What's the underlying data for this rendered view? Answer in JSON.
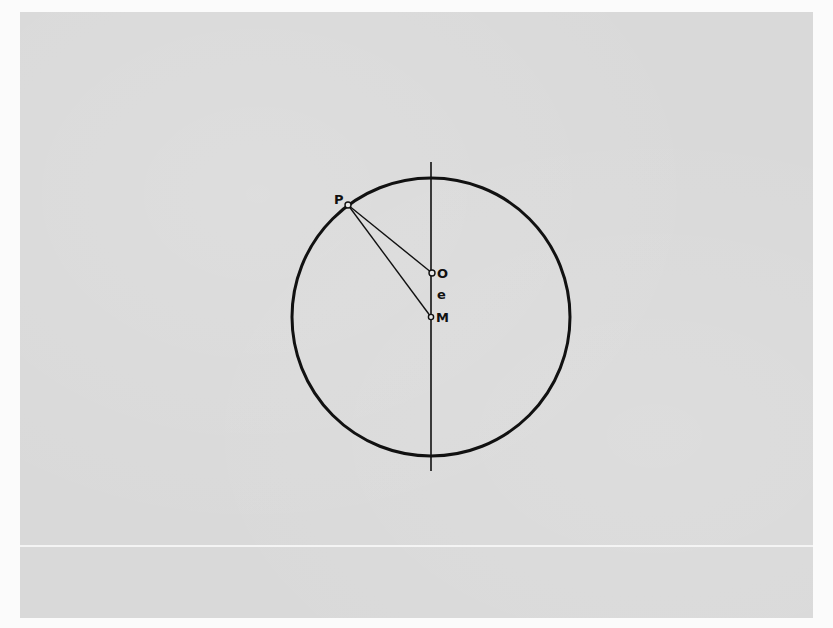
{
  "diagram": {
    "title": "",
    "colors": {
      "background": "#d9d9d9",
      "ink": "#111111",
      "margin": "#fbfbfb"
    },
    "circle": {
      "cx": 431,
      "cy": 317,
      "r": 139,
      "stroke_width": 3
    },
    "axis": {
      "x": 431,
      "y_top": 162,
      "y_bottom": 471
    },
    "points": [
      {
        "id": "P",
        "label": "P",
        "x": 348,
        "y": 205,
        "label_x": 334,
        "label_y": 204
      },
      {
        "id": "O",
        "label": "O",
        "x": 432,
        "y": 273,
        "label_x": 437,
        "label_y": 278
      },
      {
        "id": "M",
        "label": "M",
        "x": 431,
        "y": 317,
        "label_x": 436,
        "label_y": 322
      }
    ],
    "segments": [
      {
        "from": "P",
        "to": "O"
      },
      {
        "from": "P",
        "to": "M"
      }
    ],
    "annotations": [
      {
        "text": "e",
        "x": 437,
        "y": 299,
        "meaning": "distance between O and M"
      }
    ]
  }
}
